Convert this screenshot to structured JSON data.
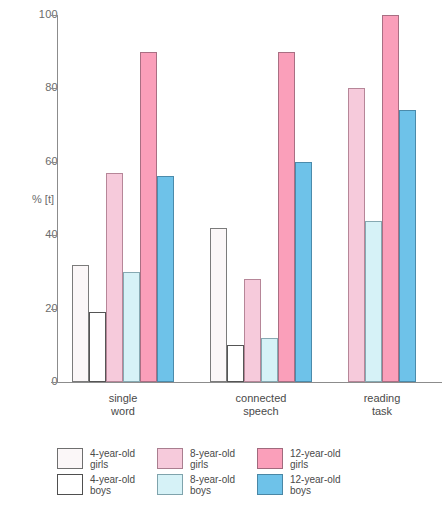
{
  "chart_data": {
    "type": "bar",
    "title": "",
    "xlabel": "",
    "ylabel": "% [t]",
    "ylim": [
      0,
      100
    ],
    "yticks": [
      0,
      20,
      40,
      60,
      80,
      100
    ],
    "ytick_labels": [
      "0",
      "20",
      "40",
      "60",
      "80",
      "100"
    ],
    "grid": false,
    "legend_position": "bottom-left",
    "categories": [
      "single\nword",
      "connected\nspeech",
      "reading\ntask"
    ],
    "category_labels": [
      "single word",
      "connected speech",
      "reading task"
    ],
    "series": [
      {
        "name": "4-year-old\ngirls",
        "key": "s4g",
        "color": "#fbf7f8",
        "values": [
          32,
          42,
          null
        ]
      },
      {
        "name": "4-year-old\nboys",
        "key": "s4b",
        "color": "#ffffff",
        "values": [
          19,
          10,
          null
        ]
      },
      {
        "name": "8-year-old\ngirls",
        "key": "s8g",
        "color": "#f6cadb",
        "values": [
          57,
          28,
          80
        ]
      },
      {
        "name": "8-year-old\nboys",
        "key": "s8b",
        "color": "#d6f2f7",
        "values": [
          30,
          12,
          44
        ]
      },
      {
        "name": "12-year-old\ngirls",
        "key": "s12g",
        "color": "#fa9fba",
        "values": [
          90,
          90,
          100
        ]
      },
      {
        "name": "12-year-old\nboys",
        "key": "s12b",
        "color": "#6ec2e9",
        "values": [
          56,
          60,
          74
        ]
      }
    ]
  },
  "axis": {
    "y_title": "% [t]",
    "ticks": [
      "100",
      "80",
      "60",
      "40",
      "20",
      "0"
    ]
  },
  "categories": [
    {
      "line1": "single",
      "line2": "word"
    },
    {
      "line1": "connected",
      "line2": "speech"
    },
    {
      "line1": "reading",
      "line2": "task"
    }
  ],
  "legend": {
    "columns": [
      {
        "entries": [
          {
            "key": "s4g",
            "line1": "4-year-old",
            "line2": "girls"
          },
          {
            "key": "s4b",
            "line1": "4-year-old",
            "line2": "boys"
          }
        ]
      },
      {
        "entries": [
          {
            "key": "s8g",
            "line1": "8-year-old",
            "line2": "girls"
          },
          {
            "key": "s8b",
            "line1": "8-year-old",
            "line2": "boys"
          }
        ]
      },
      {
        "entries": [
          {
            "key": "s12g",
            "line1": "12-year-old",
            "line2": "girls"
          },
          {
            "key": "s12b",
            "line1": "12-year-old",
            "line2": "boys"
          }
        ]
      }
    ]
  },
  "caption": {
    "text": ""
  }
}
